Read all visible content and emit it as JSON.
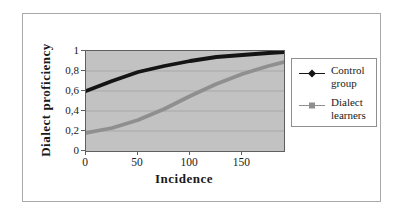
{
  "figure": {
    "background": "#ffffff",
    "frame_border_color": "#a9a9a9"
  },
  "chart_data": {
    "type": "line",
    "title": "",
    "xlabel": "Incidence",
    "ylabel": "Dialect proficiency",
    "xlim": [
      0,
      190
    ],
    "ylim": [
      0,
      1
    ],
    "x_ticks": {
      "values": [
        0,
        50,
        100,
        150
      ],
      "labels": [
        "0",
        "50",
        "100",
        "150"
      ]
    },
    "y_ticks": {
      "values": [
        1,
        0.8,
        0.6,
        0.4,
        0.2,
        0
      ],
      "labels": [
        "1",
        "0,8",
        "0,6",
        "0,4",
        "0,2",
        "0"
      ]
    },
    "grid": "horizontal-major",
    "gridline_color": "#a8a8a8",
    "plot_background": "#c2c2c2",
    "legend_position": "right",
    "x": [
      0,
      25,
      50,
      75,
      100,
      125,
      150,
      175,
      190
    ],
    "series": [
      {
        "name": "Control group",
        "marker": "diamond",
        "color": "#141414",
        "values": [
          0.6,
          0.7,
          0.79,
          0.85,
          0.9,
          0.94,
          0.96,
          0.98,
          0.99
        ]
      },
      {
        "name": "Dialect learners",
        "marker": "square",
        "color": "#8f8f8f",
        "values": [
          0.18,
          0.23,
          0.31,
          0.42,
          0.55,
          0.67,
          0.77,
          0.85,
          0.89
        ]
      }
    ]
  }
}
